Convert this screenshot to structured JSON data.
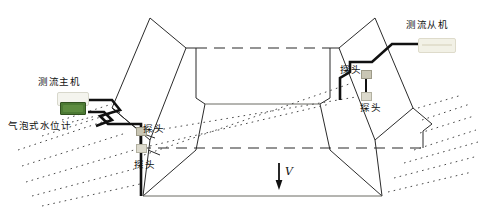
{
  "figure": {
    "type": "trapezoidal-channel-flow-measurement-diagram"
  },
  "labels": {
    "master_unit": "测流主机",
    "slave_unit": "测流从机",
    "water_level_gauge": "气泡式水位计",
    "probe_left_upper": "探头",
    "probe_left_lower": "探头",
    "probe_right_upper": "探头",
    "probe_right_lower": "探头",
    "velocity": "V"
  },
  "colors": {
    "outline": "#2b2b2b",
    "cable": "#111111",
    "dotted": "#4a4a4a",
    "screen_green": "#4c7a34",
    "device_body": "#f4f4ee",
    "slave_body": "#f2f1e6",
    "probe_body": "#c9c6b4",
    "background": "#ffffff"
  },
  "annotations": {
    "flow_direction": "downstream",
    "arrow_symbol": "↓"
  }
}
